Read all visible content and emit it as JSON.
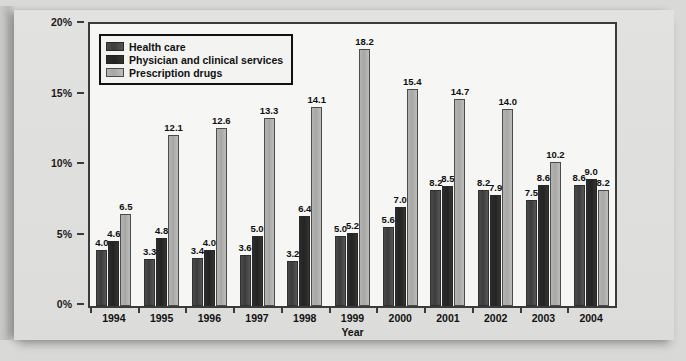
{
  "chart_data": {
    "type": "bar",
    "title": "",
    "xlabel": "Year",
    "ylabel": "",
    "ylim": [
      0,
      20
    ],
    "ytick_labels": [
      "0%",
      "5%",
      "10%",
      "15%",
      "20%"
    ],
    "ytick_values": [
      0,
      5,
      10,
      15,
      20
    ],
    "grid": false,
    "legend_position": "top-left",
    "categories": [
      "1994",
      "1995",
      "1996",
      "1997",
      "1998",
      "1999",
      "2000",
      "2001",
      "2002",
      "2003",
      "2004"
    ],
    "series": [
      {
        "name": "Health care",
        "color": "#3c3c3c",
        "values": [
          4.0,
          3.3,
          3.4,
          3.6,
          3.2,
          5.0,
          5.6,
          8.2,
          8.2,
          7.5,
          8.6
        ],
        "labels": [
          "4.0",
          "3.3",
          "3.4",
          "3.6",
          "3.2",
          "5.0",
          "5.6",
          "8.2",
          "8.2",
          "7.5",
          "8.6"
        ]
      },
      {
        "name": "Physician and clinical services",
        "color": "#232323",
        "values": [
          4.6,
          4.8,
          4.0,
          5.0,
          6.4,
          5.2,
          7.0,
          8.5,
          7.9,
          8.6,
          9.0
        ],
        "labels": [
          "4.6",
          "4.8",
          "4.0",
          "5.0",
          "6.4",
          "5.2",
          "7.0",
          "8.5",
          "7.9",
          "8.6",
          "9.0"
        ]
      },
      {
        "name": "Prescription drugs",
        "color": "#a7a7a5",
        "values": [
          6.5,
          12.1,
          12.6,
          13.3,
          14.1,
          18.2,
          15.4,
          14.7,
          14.0,
          10.2,
          8.2
        ],
        "labels": [
          "6.5",
          "12.1",
          "12.6",
          "13.3",
          "14.1",
          "18.2",
          "15.4",
          "14.7",
          "14.0",
          "10.2",
          "8.2"
        ]
      }
    ]
  },
  "legend": {
    "items": [
      {
        "label": "Health care"
      },
      {
        "label": "Physician and clinical services"
      },
      {
        "label": "Prescription drugs"
      }
    ]
  },
  "axes": {
    "x_title": "Year"
  },
  "page": {
    "faint_header": ""
  }
}
